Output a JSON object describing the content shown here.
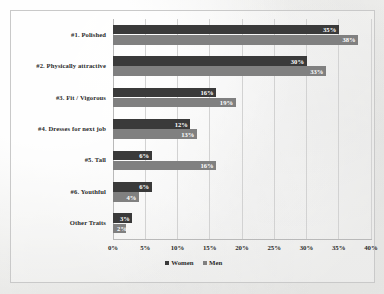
{
  "chart_data": {
    "type": "bar",
    "orientation": "horizontal",
    "title": "",
    "xlabel": "",
    "ylabel": "",
    "xlim": [
      0,
      40
    ],
    "xtick_labels": [
      "0%",
      "5%",
      "10%",
      "15%",
      "20%",
      "25%",
      "30%",
      "35%",
      "40%"
    ],
    "xtick_values": [
      0,
      5,
      10,
      15,
      20,
      25,
      30,
      35,
      40
    ],
    "grid": "vertical",
    "legend_position": "bottom-center",
    "categories": [
      "#1. Polished",
      "#2. Physically attractive",
      "#3. Fit / Vigorous",
      "#4. Dresses for next job",
      "#5. Tall",
      "#6. Youthful",
      "Other Traits"
    ],
    "series": [
      {
        "name": "Women",
        "color": "#3a3a3a",
        "values": [
          35,
          30,
          16,
          12,
          6,
          6,
          3
        ],
        "labels": [
          "35%",
          "30%",
          "16%",
          "12%",
          "6%",
          "6%",
          "3%"
        ]
      },
      {
        "name": "Men",
        "color": "#808080",
        "values": [
          38,
          33,
          19,
          13,
          16,
          4,
          2
        ],
        "labels": [
          "38%",
          "33%",
          "19%",
          "13%",
          "16%",
          "4%",
          "2%"
        ]
      }
    ]
  },
  "legend": {
    "items": [
      {
        "label": "Women",
        "color": "#3a3a3a"
      },
      {
        "label": "Men",
        "color": "#808080"
      }
    ]
  }
}
